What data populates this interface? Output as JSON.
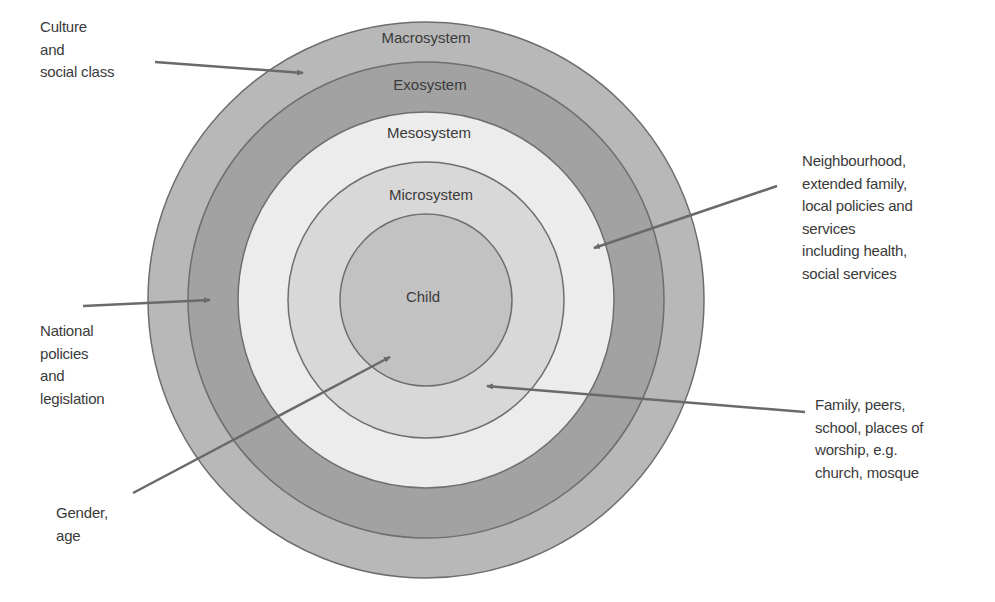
{
  "diagram": {
    "colors": {
      "macrosystem": "#b8b8b8",
      "exosystem": "#a2a2a2",
      "mesosystem": "#ececec",
      "microsystem": "#d8d8d8",
      "child": "#c2c2c2",
      "stroke": "#6e6e6e",
      "arrow": "#6a6a6a",
      "text": "#3a3a3a"
    },
    "rings": [
      {
        "id": "macrosystem",
        "label": "Macrosystem",
        "radius": 278
      },
      {
        "id": "exosystem",
        "label": "Exosystem",
        "radius": 238
      },
      {
        "id": "mesosystem",
        "label": "Mesosystem",
        "radius": 188
      },
      {
        "id": "microsystem",
        "label": "Microsystem",
        "radius": 138
      },
      {
        "id": "child",
        "label": "Child",
        "radius": 86
      }
    ],
    "annotations": [
      {
        "id": "culture",
        "text": "Culture\nand\nsocial class",
        "points_to": "Macrosystem"
      },
      {
        "id": "neighbourhood",
        "text": "Neighbourhood,\nextended family,\nlocal policies and\nservices\nincluding health,\nsocial services",
        "points_to": "Mesosystem"
      },
      {
        "id": "national",
        "text": "National\npolicies\nand\nlegislation",
        "points_to": "Exosystem"
      },
      {
        "id": "family",
        "text": "Family, peers,\nschool, places of\nworship, e.g.\nchurch, mosque",
        "points_to": "Microsystem"
      },
      {
        "id": "gender",
        "text": "Gender,\nage",
        "points_to": "Child"
      }
    ]
  }
}
